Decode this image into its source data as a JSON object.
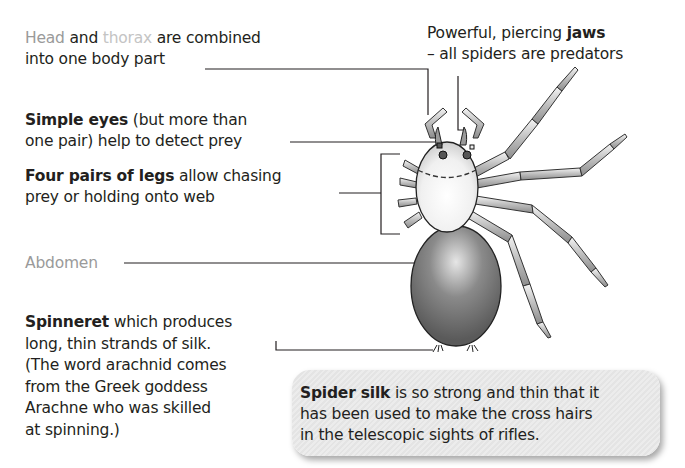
{
  "labels": {
    "head_thorax": {
      "line1_word1": "Head",
      "line1_word2": " and ",
      "line1_word3": "thorax",
      "line1_word4": " are combined",
      "line2": "into one body part"
    },
    "jaws": {
      "line1_plain": "Powerful, piercing ",
      "line1_bold": "jaws",
      "line2": "– all spiders are predators"
    },
    "eyes": {
      "line1_bold": "Simple eyes",
      "line1_plain": " (but more than",
      "line2": "one pair) help to detect prey"
    },
    "legs": {
      "line1_bold": "Four pairs of legs",
      "line1_plain": " allow chasing",
      "line2": "prey or holding onto web"
    },
    "abdomen": {
      "text": "Abdomen"
    },
    "spinneret": {
      "line1_bold": "Spinneret",
      "line1_plain": " which produces",
      "line2": "long, thin strands of silk.",
      "line3": "(The word arachnid comes",
      "line4": "from the Greek goddess",
      "line5": "Arachne who was skilled",
      "line6": "at spinning.)"
    }
  },
  "callout": {
    "line1_bold": "Spider silk",
    "line1_plain": " is so strong and thin that it",
    "line2": "has been used to make the cross hairs",
    "line3": "in the telescopic sights of rifles."
  },
  "colors": {
    "text": "#231f20",
    "label_grey": "#9a9a9a",
    "label_light_grey": "#c4c4c4",
    "abdomen": "#6e6e6e",
    "cephalothorax": "#f2f2f2",
    "callout_bg": "#e8e8e8"
  }
}
